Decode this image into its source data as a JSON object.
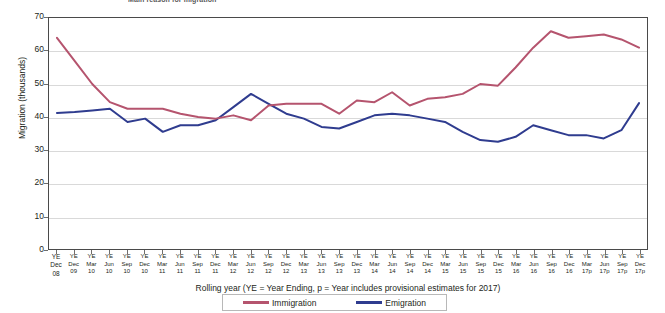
{
  "title_fragment": "Main reason for migration",
  "axes": {
    "y_title": "Migration (thousands)",
    "x_title": "Rolling year (YE = Year Ending,  p = Year includes provisional  estimates for  2017)",
    "y_ticks": [
      "0",
      "10",
      "20",
      "30",
      "40",
      "50",
      "60",
      "70"
    ]
  },
  "legend": {
    "immigration_label": "Immigration",
    "emigration_label": "Emigration",
    "immigration_color": "#b5546e",
    "emigration_color": "#2f3c8f"
  },
  "chart_data": {
    "type": "line",
    "title": "Main reason for migration",
    "xlabel": "Rolling year (YE = Year Ending,  p = Year includes provisional  estimates for  2017)",
    "ylabel": "Migration (thousands)",
    "ylim": [
      0,
      70
    ],
    "ytick_step": 10,
    "grid": true,
    "legend_position": "bottom",
    "categories": [
      "YE\nDec\n08",
      "YE\nDec\n09",
      "YE\nMar\n10",
      "YE\nJun\n10",
      "YE\nSep\n10",
      "YE\nDec\n10",
      "YE\nMar\n11",
      "YE\nJun\n11",
      "YE\nSep\n11",
      "YE\nDec\n11",
      "YE\nMar\n12",
      "YE\nJun\n12",
      "YE\nSep\n12",
      "YE\nDec\n12",
      "YE\nMar\n13",
      "YE\nJun\n13",
      "YE\nSep\n13",
      "YE\nDec\n13",
      "YE\nMar\n14",
      "YE\nJun\n14",
      "YE\nSep\n14",
      "YE\nDec\n14",
      "YE\nMar\n15",
      "YE\nJun\n15",
      "YE\nSep\n15",
      "YE\nDec\n15",
      "YE\nMar\n16",
      "YE\nJun\n16",
      "YE\nSep\n16",
      "YE\nDec\n16",
      "YE\nMar\n17p",
      "YE\nJun\n17p",
      "YE\nSep\n17p",
      "YE\nDec\n17p"
    ],
    "series": [
      {
        "name": "Immigration",
        "color": "#b5546e",
        "values": [
          64,
          57,
          50,
          44.5,
          42.5,
          42.5,
          42.5,
          41,
          40,
          39.5,
          40.5,
          39,
          43.5,
          44,
          44,
          44,
          41,
          45,
          44.5,
          47.5,
          43.5,
          45.5,
          46,
          47,
          50,
          49.5,
          55,
          61,
          66,
          64,
          64.5,
          65,
          63.5,
          61
        ]
      },
      {
        "name": "Emigration",
        "color": "#2f3c8f",
        "values": [
          41.2,
          41.5,
          42,
          42.5,
          38.5,
          39.5,
          35.5,
          37.5,
          37.5,
          39,
          43,
          47,
          44,
          41,
          39.5,
          37,
          36.5,
          38.5,
          40.5,
          41,
          40.5,
          39.5,
          38.5,
          35.5,
          33,
          32.5,
          34,
          37.5,
          36,
          34.5,
          34.5,
          33.5,
          36,
          44.2
        ]
      }
    ]
  }
}
